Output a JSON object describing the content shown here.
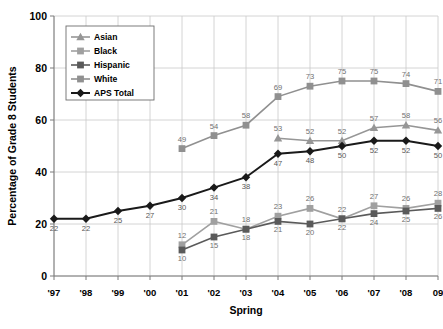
{
  "chart_data": {
    "type": "line",
    "title": "",
    "xlabel": "Spring",
    "ylabel": "Percentage of Grade 8 Students",
    "categories": [
      "'97",
      "'98",
      "'99",
      "'00",
      "'01",
      "'02",
      "'03",
      "'04",
      "'05",
      "'06",
      "'07",
      "'08",
      "09"
    ],
    "ylim": [
      0,
      100
    ],
    "yticks": [
      0,
      20,
      40,
      60,
      80,
      100
    ],
    "grid": true,
    "legend_position": "top-left-inside",
    "series": [
      {
        "name": "Asian",
        "marker": "triangle",
        "color": "#969696",
        "values": [
          null,
          null,
          null,
          null,
          null,
          null,
          null,
          53,
          52,
          52,
          57,
          58,
          56
        ]
      },
      {
        "name": "Black",
        "marker": "square",
        "color": "#a0a0a0",
        "values": [
          null,
          null,
          null,
          null,
          12,
          21,
          18,
          23,
          26,
          22,
          27,
          26,
          28
        ]
      },
      {
        "name": "Hispanic",
        "marker": "square",
        "color": "#5a5a5a",
        "values": [
          null,
          null,
          null,
          null,
          10,
          15,
          18,
          21,
          20,
          22,
          24,
          25,
          26
        ]
      },
      {
        "name": "White",
        "marker": "square",
        "color": "#909090",
        "values": [
          null,
          null,
          null,
          null,
          49,
          54,
          58,
          69,
          73,
          75,
          75,
          74,
          71
        ]
      },
      {
        "name": "APS Total",
        "marker": "diamond",
        "color": "#1a1a1a",
        "values": [
          22,
          22,
          25,
          27,
          30,
          34,
          38,
          47,
          48,
          50,
          52,
          52,
          50
        ]
      }
    ]
  }
}
